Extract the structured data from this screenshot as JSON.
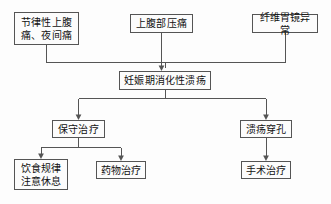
{
  "diagram": {
    "type": "flowchart",
    "orientation": "top-down",
    "colors": {
      "background": "#fdfdfd",
      "box_fill": "#fcfcfc",
      "box_border": "#555555",
      "connector": "#555555",
      "text": "#111111"
    },
    "nodes": [
      {
        "id": "rhythmic-pain",
        "label": "节律性上腹\n痛、夜间痛",
        "role": "symptom"
      },
      {
        "id": "epigastric-tend",
        "label": "上腹部压痛",
        "role": "sign"
      },
      {
        "id": "gastroscopy",
        "label": "纤维胃镜异常",
        "role": "examination"
      },
      {
        "id": "diagnosis",
        "label": "妊娠期消化性溃疡",
        "role": "diagnosis"
      },
      {
        "id": "conservative",
        "label": "保守治疗",
        "role": "treatment"
      },
      {
        "id": "perforation",
        "label": "溃疡穿孔",
        "role": "complication"
      },
      {
        "id": "diet-rest",
        "label": "饮食规律\n注意休息",
        "role": "treatment-detail"
      },
      {
        "id": "drug-therapy",
        "label": "药物治疗",
        "role": "treatment-detail"
      },
      {
        "id": "surgery",
        "label": "手术治疗",
        "role": "treatment-detail"
      }
    ],
    "edges": [
      {
        "from": "rhythmic-pain",
        "to": "diagnosis",
        "style": "elbow",
        "arrow": true
      },
      {
        "from": "epigastric-tend",
        "to": "diagnosis",
        "style": "straight",
        "arrow": true
      },
      {
        "from": "gastroscopy",
        "to": "diagnosis",
        "style": "elbow",
        "arrow": true
      },
      {
        "from": "diagnosis",
        "to": "conservative",
        "style": "elbow",
        "arrow": true
      },
      {
        "from": "diagnosis",
        "to": "perforation",
        "style": "elbow",
        "arrow": true
      },
      {
        "from": "conservative",
        "to": "diet-rest",
        "style": "elbow",
        "arrow": true
      },
      {
        "from": "conservative",
        "to": "drug-therapy",
        "style": "elbow",
        "arrow": true
      },
      {
        "from": "perforation",
        "to": "surgery",
        "style": "straight",
        "arrow": true
      }
    ]
  }
}
